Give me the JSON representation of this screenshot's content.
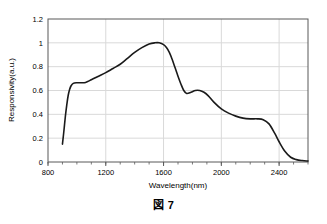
{
  "figure": {
    "caption": "図 7"
  },
  "chart_data": {
    "type": "line",
    "title": "",
    "xlabel": "Wavelength(nm)",
    "ylabel": "Responsivity(a.u.)",
    "xlim": [
      800,
      2600
    ],
    "ylim": [
      0,
      1.2
    ],
    "grid": true,
    "legend": null,
    "line_color": "#1a1a1a",
    "grid_color": "#d9d9d9",
    "axis_color": "#595959",
    "x_ticks": [
      800,
      1200,
      1600,
      2000,
      2400
    ],
    "x_tick_labels": [
      "800",
      "1200",
      "1600",
      "2000",
      "2400"
    ],
    "x_minor_tick_step": 100,
    "y_ticks": [
      0,
      0.2,
      0.4,
      0.6,
      0.8,
      1,
      1.2
    ],
    "y_tick_labels": [
      "0",
      "0.2",
      "0.4",
      "0.6",
      "0.8",
      "1",
      "1.2"
    ],
    "series": [
      {
        "name": "responsivity",
        "x": [
          900,
          910,
          920,
          930,
          940,
          950,
          960,
          975,
          1000,
          1030,
          1060,
          1100,
          1150,
          1200,
          1250,
          1300,
          1350,
          1400,
          1450,
          1500,
          1540,
          1570,
          1600,
          1620,
          1640,
          1660,
          1680,
          1700,
          1720,
          1740,
          1760,
          1790,
          1820,
          1850,
          1880,
          1910,
          1950,
          2000,
          2050,
          2100,
          2150,
          2200,
          2250,
          2290,
          2330,
          2370,
          2400,
          2440,
          2480,
          2520,
          2560,
          2600
        ],
        "y": [
          0.15,
          0.26,
          0.38,
          0.48,
          0.56,
          0.61,
          0.64,
          0.66,
          0.665,
          0.665,
          0.668,
          0.69,
          0.72,
          0.75,
          0.785,
          0.82,
          0.87,
          0.92,
          0.96,
          0.99,
          1.0,
          1.0,
          0.985,
          0.96,
          0.92,
          0.86,
          0.79,
          0.72,
          0.655,
          0.6,
          0.575,
          0.585,
          0.6,
          0.6,
          0.585,
          0.555,
          0.5,
          0.445,
          0.41,
          0.385,
          0.368,
          0.362,
          0.362,
          0.355,
          0.32,
          0.24,
          0.17,
          0.09,
          0.04,
          0.02,
          0.012,
          0.008
        ]
      }
    ]
  }
}
